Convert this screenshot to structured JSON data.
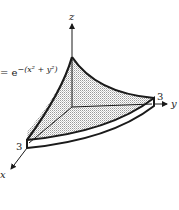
{
  "diagram": {
    "equation_label": "= e−(x² + y²)",
    "equation_parts": {
      "prefix": "= e",
      "exponent": "−(x² + y²)"
    },
    "axes": {
      "x_label": "x",
      "y_label": "y",
      "z_label": "z"
    },
    "ticks": {
      "x_tick": "3",
      "y_tick": "3"
    },
    "colors": {
      "ink": "#1a1a1a",
      "fill": "#d9d9d9",
      "background": "#ffffff"
    }
  }
}
